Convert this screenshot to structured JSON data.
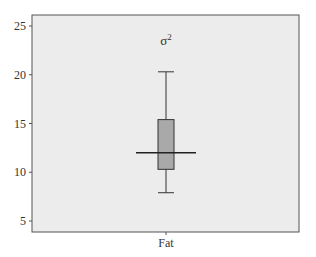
{
  "chart_data": {
    "type": "box",
    "xlabel": "",
    "ylabel": "",
    "categories": [
      "Fat"
    ],
    "boxes": [
      {
        "name": "Fat",
        "whisker_low": 7.9,
        "q1": 10.3,
        "median": 12.0,
        "q3": 15.4,
        "whisker_high": 20.3
      }
    ],
    "ylim": [
      4,
      26
    ],
    "yticks": [
      5,
      10,
      15,
      20,
      25
    ],
    "grid": false,
    "legend": null
  },
  "colors": {
    "plot_background": "#ececec",
    "box_fill": "#a9a9a9",
    "line": "#333333",
    "frame": "#555555"
  }
}
